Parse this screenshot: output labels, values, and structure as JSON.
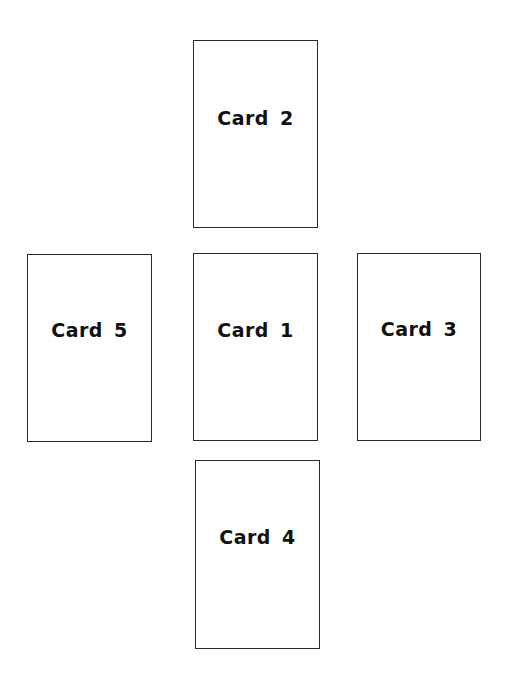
{
  "diagram": {
    "type": "card-spread-layout",
    "cards": [
      {
        "label": "Card 1",
        "position": "center",
        "box": {
          "x": 193,
          "y": 253,
          "w": 125,
          "h": 188
        }
      },
      {
        "label": "Card 2",
        "position": "top",
        "box": {
          "x": 193,
          "y": 40,
          "w": 125,
          "h": 188
        }
      },
      {
        "label": "Card 3",
        "position": "right",
        "box": {
          "x": 357,
          "y": 253,
          "w": 124,
          "h": 188
        }
      },
      {
        "label": "Card 4",
        "position": "bottom",
        "box": {
          "x": 195,
          "y": 460,
          "w": 125,
          "h": 189
        }
      },
      {
        "label": "Card 5",
        "position": "left",
        "box": {
          "x": 27,
          "y": 254,
          "w": 125,
          "h": 188
        }
      }
    ],
    "colors": {
      "border": "#2a2a2a",
      "text": "#111111",
      "background": "#ffffff"
    }
  }
}
